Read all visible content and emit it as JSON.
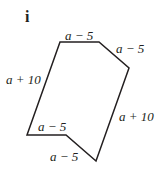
{
  "part_label": "i",
  "shape": {
    "type": "hexagon",
    "vertices": [
      [
        60,
        42
      ],
      [
        99,
        42
      ],
      [
        129,
        68
      ],
      [
        96,
        161
      ],
      [
        66,
        135
      ],
      [
        27,
        135
      ]
    ],
    "stroke": "#231f20"
  },
  "labels": {
    "top": "a − 5",
    "top_right": "a − 5",
    "left": "a + 10",
    "right": "a + 10",
    "bottom_left": "a − 5",
    "bottom_notch": "a − 5"
  }
}
